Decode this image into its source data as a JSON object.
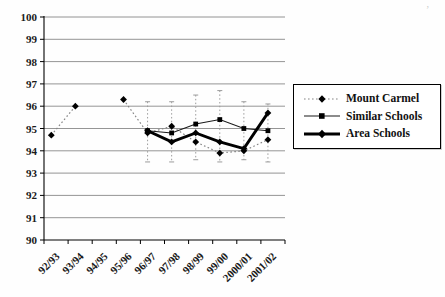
{
  "scan_artifact": "’",
  "chart_data": {
    "type": "line",
    "title": "",
    "xlabel": "",
    "ylabel": "",
    "grid": true,
    "legend_position": "right",
    "categories": [
      "92/93",
      "93/94",
      "94/95",
      "95/96",
      "96/97",
      "97/98",
      "98/99",
      "99/00",
      "2000/01",
      "2001/02"
    ],
    "y_axis": {
      "min": 90,
      "max": 100,
      "step": 1,
      "tick_labels": [
        "90",
        "91",
        "92",
        "93",
        "94",
        "95",
        "96",
        "97",
        "98",
        "99",
        "100"
      ]
    },
    "x_axis": {
      "label_rotation": -45
    },
    "series": [
      {
        "name": "Mount Carmel",
        "line_style": "dotted",
        "marker": "diamond",
        "values": [
          94.7,
          96.0,
          null,
          96.3,
          94.8,
          95.1,
          94.4,
          93.9,
          94.0,
          94.5
        ]
      },
      {
        "name": "Similar Schools",
        "line_style": "solid-thin",
        "marker": "square",
        "values": [
          null,
          null,
          null,
          null,
          94.9,
          94.8,
          95.2,
          95.4,
          95.0,
          94.9
        ]
      },
      {
        "name": "Area Schools",
        "line_style": "solid-thick",
        "marker": "diamond",
        "values": [
          null,
          null,
          null,
          null,
          94.9,
          94.4,
          94.8,
          94.4,
          94.1,
          95.7
        ]
      }
    ],
    "error_bars": [
      {
        "category": "96/97",
        "low": 93.5,
        "high": 96.2
      },
      {
        "category": "97/98",
        "low": 93.5,
        "high": 96.2
      },
      {
        "category": "98/99",
        "low": 93.6,
        "high": 96.5
      },
      {
        "category": "99/00",
        "low": 93.5,
        "high": 96.7
      },
      {
        "category": "2000/01",
        "low": 93.6,
        "high": 96.2
      },
      {
        "category": "2001/02",
        "low": 93.5,
        "high": 96.1
      }
    ],
    "colors": {
      "line": "#000000",
      "grid": "#7a7a7a",
      "dotted_series": "#858585",
      "error_bar": "#9c9c9c"
    }
  }
}
